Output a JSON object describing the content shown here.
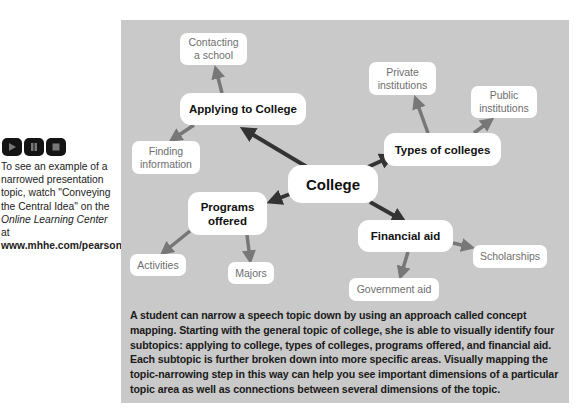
{
  "sidebar": {
    "media_controls": [
      {
        "name": "play",
        "icon": "play-icon"
      },
      {
        "name": "pause",
        "icon": "pause-icon"
      },
      {
        "name": "stop",
        "icon": "stop-icon"
      }
    ],
    "text_1": "To see an example of a narrowed presentation topic, watch \"Conveying the Central Idea\" on the ",
    "text_italic": "Online Learning Center",
    "text_2": " at ",
    "text_bold": "www.mhhe.com/pearson4e",
    "text_3": "."
  },
  "concept_map": {
    "center": "College",
    "subtopics": {
      "applying": {
        "label": "Applying to College",
        "children": [
          "Contacting a school",
          "Finding information"
        ]
      },
      "types": {
        "label": "Types of colleges",
        "children": [
          "Private institutions",
          "Public institutions"
        ]
      },
      "programs": {
        "label": "Programs offered",
        "children": [
          "Activities",
          "Majors"
        ]
      },
      "financial": {
        "label": "Financial aid",
        "children": [
          "Scholarships",
          "Government aid"
        ]
      }
    },
    "colors": {
      "panel": "#c9c9c9",
      "primary_arrow": "#333333",
      "secondary_arrow": "#777777",
      "leaf_text": "#6e6e6e"
    }
  },
  "caption": "A student can narrow a speech topic down by using an approach called concept mapping. Starting with the general topic of college, she is able to visually identify four subtopics: applying to college, types of colleges, programs offered, and financial aid. Each subtopic is further broken down into more specific areas. Visually mapping the topic-narrowing step in this way can help you see important dimensions of a particular topic area as well as connections between several dimensions of the topic."
}
